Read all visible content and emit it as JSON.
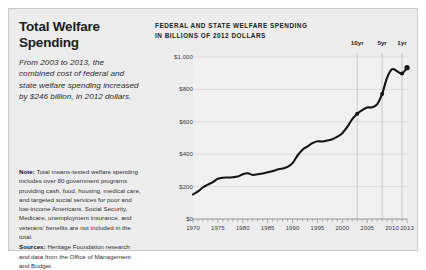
{
  "headline": {
    "line1": "Total Welfare",
    "line2": "Spending",
    "subhead": "From 2003 to 2013, the combined cost of federal and state welfare spending increased by $246 billion, in 2012 dollars."
  },
  "note": {
    "note_label": "Note:",
    "note_body": " Total means-tested welfare spending includes over 80 government programs providing cash, food, housing, medical care, and targeted social services for poor and low-income Americans. Social Security, Medicare, unemployment insurance, and veterans' benefits are not included in the total.",
    "sources_label": "Sources:",
    "sources_body": " Heritage Foundation research and data from the Office of Management and Budget."
  },
  "chart_data": {
    "type": "line",
    "title": "FEDERAL AND STATE WELFARE SPENDING",
    "subtitle": "IN BILLIONS OF 2012 DOLLARS",
    "xlabel": "",
    "ylabel": "",
    "xlim": [
      1970,
      2013
    ],
    "ylim": [
      0,
      1000
    ],
    "grid": true,
    "legend": false,
    "ytick_labels": [
      "$0",
      "$200",
      "$400",
      "$600",
      "$800",
      "$1,000"
    ],
    "ytick_values": [
      0,
      200,
      400,
      600,
      800,
      1000
    ],
    "xtick_labels": [
      "1970",
      "1975",
      "1980",
      "1985",
      "1990",
      "1995",
      "2000",
      "2005",
      "2010",
      "2013"
    ],
    "xtick_values": [
      1970,
      1975,
      1980,
      1985,
      1990,
      1995,
      2000,
      2005,
      2010,
      2013
    ],
    "line_color": "#141414",
    "series": [
      {
        "name": "Federal and state welfare spending",
        "x": [
          1970,
          1971,
          1972,
          1973,
          1974,
          1975,
          1976,
          1977,
          1978,
          1979,
          1980,
          1981,
          1982,
          1983,
          1984,
          1985,
          1986,
          1987,
          1988,
          1989,
          1990,
          1991,
          1992,
          1993,
          1994,
          1995,
          1996,
          1997,
          1998,
          1999,
          2000,
          2001,
          2002,
          2003,
          2004,
          2005,
          2006,
          2007,
          2008,
          2009,
          2010,
          2011,
          2012,
          2013
        ],
        "values": [
          152,
          170,
          196,
          212,
          228,
          248,
          255,
          256,
          258,
          262,
          276,
          282,
          272,
          276,
          281,
          288,
          296,
          305,
          312,
          322,
          345,
          392,
          428,
          448,
          468,
          480,
          478,
          484,
          492,
          508,
          530,
          568,
          616,
          650,
          672,
          688,
          690,
          708,
          772,
          872,
          925,
          912,
          898,
          934
        ]
      }
    ],
    "markers": [
      {
        "label": "10yr",
        "x": 2003,
        "y": 650
      },
      {
        "label": "5yr",
        "x": 2008,
        "y": 772
      },
      {
        "label": "1yr",
        "x": 2012,
        "y": 898
      }
    ],
    "end_point": {
      "x": 2013,
      "y": 934
    }
  }
}
